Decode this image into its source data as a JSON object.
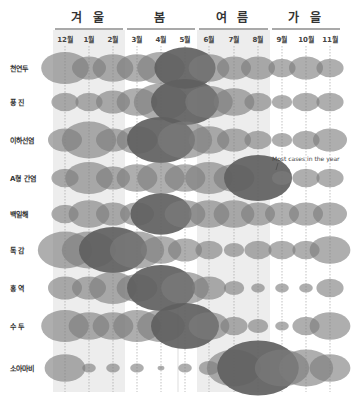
{
  "chart_data": {
    "type": "bubble",
    "title": "",
    "seasons": [
      {
        "name": "겨 울",
        "months": [
          "12월",
          "1월",
          "2월"
        ],
        "shaded": true
      },
      {
        "name": "봄",
        "months": [
          "3월",
          "4월",
          "5월"
        ],
        "shaded": false
      },
      {
        "name": "여 름",
        "months": [
          "6월",
          "7월",
          "8월"
        ],
        "shaded": true
      },
      {
        "name": "가 을",
        "months": [
          "9월",
          "10월",
          "11월"
        ],
        "shaded": false
      }
    ],
    "categories": [
      "12월",
      "1월",
      "2월",
      "3월",
      "4월",
      "5월",
      "6월",
      "7월",
      "8월",
      "9월",
      "10월",
      "11월"
    ],
    "value_scale": "relative bubble radius (1-10), estimated",
    "series": [
      {
        "name": "천연두",
        "values": [
          7,
          5,
          6,
          6,
          7,
          9,
          6,
          5,
          5,
          4,
          5,
          4
        ],
        "peak": "5월"
      },
      {
        "name": "풍 진",
        "values": [
          4,
          4,
          5,
          6,
          8,
          10,
          7,
          6,
          4,
          3,
          4,
          4
        ],
        "peak": "5월"
      },
      {
        "name": "이하선염",
        "values": [
          5,
          8,
          5,
          6,
          10,
          8,
          6,
          5,
          4,
          3,
          4,
          5
        ],
        "peak": "4월"
      },
      {
        "name": "A형 간염",
        "values": [
          4,
          7,
          5,
          6,
          7,
          6,
          7,
          6,
          10,
          3,
          4,
          4
        ],
        "peak": "8월"
      },
      {
        "name": "백일해",
        "values": [
          4,
          6,
          5,
          5,
          9,
          6,
          6,
          6,
          5,
          5,
          5,
          5
        ],
        "peak": "4월"
      },
      {
        "name": "독 감",
        "values": [
          8,
          8,
          10,
          8,
          6,
          5,
          4,
          3,
          4,
          4,
          4,
          6
        ],
        "peak": "2월"
      },
      {
        "name": "홍 역",
        "values": [
          5,
          5,
          7,
          6,
          10,
          7,
          5,
          3,
          2,
          2,
          2,
          4
        ],
        "peak": "4월"
      },
      {
        "name": "수 두",
        "values": [
          7,
          6,
          6,
          7,
          7,
          10,
          6,
          4,
          3,
          2,
          4,
          6
        ],
        "peak": "5월"
      },
      {
        "name": "소아마비",
        "values": [
          6,
          2,
          2,
          2,
          1,
          2,
          3,
          8,
          12,
          8,
          8,
          6
        ],
        "peak": "8월"
      }
    ],
    "annotations": [
      {
        "text": "Most cases in the year",
        "target": "A형 간염 / 8월"
      }
    ],
    "legend": "none",
    "grid": "dashed vertical lines per month"
  },
  "annotation_text": "Most cases in the year"
}
